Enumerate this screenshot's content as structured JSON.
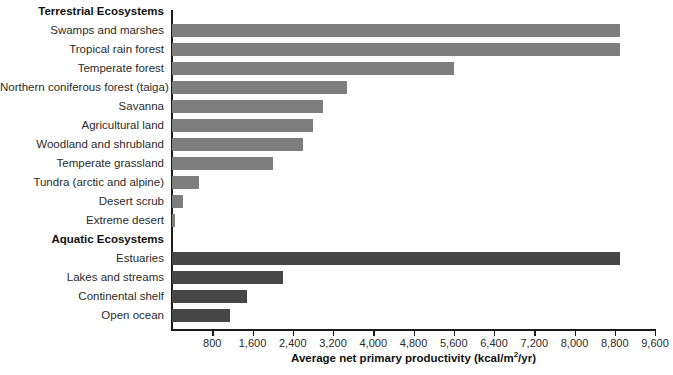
{
  "chart_data": {
    "type": "bar",
    "orientation": "horizontal",
    "title": "",
    "xlabel": "Average net primary productivity (kcal/m2/yr)",
    "xlabel_parts": {
      "main": "Average net primary productivity (kcal/m",
      "sup": "2",
      "tail": "/yr)"
    },
    "ylabel": "",
    "xlim": [
      0,
      9600
    ],
    "xticks": [
      800,
      1600,
      2400,
      3200,
      4000,
      4800,
      5600,
      6400,
      7200,
      8000,
      8800,
      9600
    ],
    "xtick_labels": [
      "800",
      "1,600",
      "2,400",
      "3,200",
      "4,000",
      "4,800",
      "5,600",
      "6,400",
      "7,200",
      "8,000",
      "8,800",
      "9,600"
    ],
    "grid": false,
    "legend": "none",
    "colors": {
      "terrestrial": "#7e7e7e",
      "aquatic": "#474747",
      "axis": "#1b1b1b",
      "text": "#2b2b2b"
    },
    "groups": [
      {
        "name": "Terrestrial Ecosystems",
        "series_key": "terrestrial",
        "categories": [
          "Swamps and marshes",
          "Tropical rain forest",
          "Temperate forest",
          "Northern coniferous forest (taiga)",
          "Savanna",
          "Agricultural land",
          "Woodland and shrubland",
          "Temperate grassland",
          "Tundra (arctic and alpine)",
          "Desert scrub",
          "Extreme desert"
        ],
        "values": [
          8900,
          8900,
          5600,
          3480,
          3000,
          2800,
          2600,
          2000,
          540,
          220,
          60
        ]
      },
      {
        "name": "Aquatic Ecosystems",
        "series_key": "aquatic",
        "categories": [
          "Estuaries",
          "Lakes and streams",
          "Continental shelf",
          "Open ocean"
        ],
        "values": [
          8900,
          2200,
          1500,
          1150
        ]
      }
    ]
  }
}
